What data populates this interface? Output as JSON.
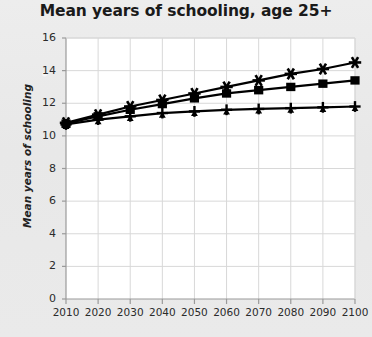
{
  "chart_data": {
    "type": "line",
    "title": "Mean years of schooling, age 25+",
    "xlabel": "",
    "ylabel": "Mean years of schooling",
    "x": [
      2010,
      2020,
      2030,
      2040,
      2050,
      2060,
      2070,
      2080,
      2090,
      2100
    ],
    "xlim": [
      2010,
      2100
    ],
    "ylim": [
      0,
      16
    ],
    "yticks": [
      0,
      2,
      4,
      6,
      8,
      10,
      12,
      14,
      16
    ],
    "xticks": [
      2010,
      2020,
      2030,
      2040,
      2050,
      2060,
      2070,
      2080,
      2090,
      2100
    ],
    "grid": true,
    "legend": "none",
    "series": [
      {
        "name": "upper",
        "marker": "star",
        "color": "#000000",
        "values": [
          10.8,
          11.3,
          11.8,
          12.2,
          12.6,
          13.0,
          13.4,
          13.8,
          14.1,
          14.5
        ]
      },
      {
        "name": "middle",
        "marker": "square",
        "color": "#000000",
        "values": [
          10.75,
          11.2,
          11.6,
          11.95,
          12.3,
          12.6,
          12.8,
          13.0,
          13.2,
          13.4
        ]
      },
      {
        "name": "lower",
        "marker": "plus",
        "color": "#000000",
        "values": [
          10.7,
          11.0,
          11.2,
          11.4,
          11.5,
          11.6,
          11.65,
          11.7,
          11.75,
          11.8
        ]
      }
    ]
  },
  "axes": {
    "ytick_labels": [
      "16",
      "14",
      "12",
      "10",
      "8",
      "6",
      "4",
      "2",
      "0"
    ],
    "xtick_labels": [
      "2010",
      "2020",
      "2030",
      "2040",
      "2050",
      "2060",
      "2070",
      "2080",
      "2090",
      "2100"
    ]
  },
  "colors": {
    "page_background": "#eaeaea",
    "plot_background": "#ffffff",
    "grid": "#d8d8d8",
    "axis": "#9a9a9a",
    "ink": "#000000"
  }
}
